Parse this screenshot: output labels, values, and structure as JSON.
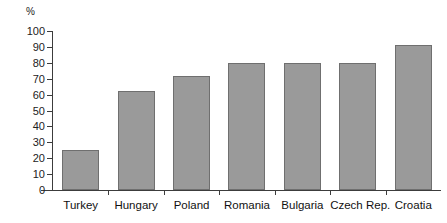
{
  "chart_data": {
    "type": "bar",
    "title": "",
    "xlabel": "",
    "ylabel": "%",
    "unit_label": "%",
    "ylim": [
      0,
      100
    ],
    "ytick_step": 10,
    "yticks": [
      100,
      90,
      80,
      70,
      60,
      50,
      40,
      30,
      20,
      10,
      0
    ],
    "ytick_labels": [
      "100",
      "90",
      "80",
      "70",
      "60",
      "50",
      "40",
      "30",
      "20",
      "10",
      "0"
    ],
    "grid": false,
    "legend": null,
    "legend_position": "none",
    "bar_color": "#9a9a9a",
    "bar_border_color": "#6f6f6f",
    "axis_color": "#3c3c3c",
    "background_color": "#ffffff",
    "categories": [
      "Turkey",
      "Hungary",
      "Poland",
      "Romania",
      "Bulgaria",
      "Czech Rep.",
      "Croatia"
    ],
    "values": [
      25,
      62,
      72,
      80,
      80,
      80,
      91
    ]
  }
}
